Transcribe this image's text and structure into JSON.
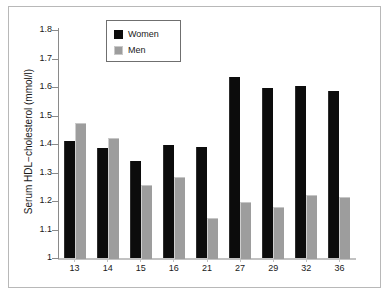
{
  "chart_data": {
    "type": "bar",
    "title": "",
    "subtitle": "",
    "xlabel": "",
    "ylabel": "Serum HDL−cholesterol (mmol/l)",
    "categories": [
      "13",
      "14",
      "15",
      "16",
      "21",
      "27",
      "29",
      "32",
      "36"
    ],
    "series": [
      {
        "name": "Women",
        "color": "#0c0c0c",
        "values": [
          1.41,
          1.385,
          1.34,
          1.395,
          1.39,
          1.635,
          1.595,
          1.605,
          1.585
        ]
      },
      {
        "name": "Men",
        "color": "#9d9d9d",
        "values": [
          1.475,
          1.42,
          1.255,
          1.285,
          1.14,
          1.195,
          1.18,
          1.22,
          1.215
        ]
      }
    ],
    "ylim": [
      1.0,
      1.8
    ],
    "ytick_labels": [
      "1.8",
      "1.7",
      "1.6",
      "1.5",
      "1.4",
      "1.3",
      "1.2",
      "1.1",
      "1"
    ],
    "ytick_values": [
      1.8,
      1.7,
      1.6,
      1.5,
      1.4,
      1.3,
      1.2,
      1.1,
      1.0
    ],
    "grid": false,
    "legend_position": "top-center",
    "legend_entries": [
      "Women",
      "Men"
    ]
  },
  "axes": {
    "y_title": "Serum HDL−cholesterol (mmol/l)"
  }
}
